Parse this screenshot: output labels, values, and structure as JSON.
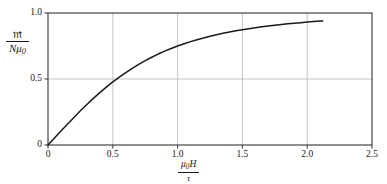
{
  "chart_data": {
    "type": "line",
    "title": "",
    "subtitle": "",
    "xlabel": "μ₀H / τ",
    "ylabel": "𝔪 / Nμ₀",
    "xlabel_numerator": "μ",
    "xlabel_numerator_sub": "0",
    "xlabel_numerator_tail": "H",
    "xlabel_denominator": "τ",
    "ylabel_numerator": "𝔪",
    "ylabel_denominator": "Nμ",
    "ylabel_denominator_sub": "0",
    "xlim": [
      0,
      2.5
    ],
    "ylim": [
      0,
      1.0
    ],
    "xticks": [
      0,
      0.5,
      1.0,
      1.5,
      2.0,
      2.5
    ],
    "xticklabels": [
      "0",
      "0.5",
      "1.0",
      "1.5",
      "2.0",
      "2.5"
    ],
    "yticks": [
      0,
      0.5,
      1.0
    ],
    "yticklabels": [
      "0",
      "0.5",
      "1.0"
    ],
    "grid": true,
    "grid_color": "#b8b8b8",
    "axis_color": "#333333",
    "curve_color": "#1a1a1a",
    "background_color": "#ffffff",
    "legend": null,
    "annotations": [],
    "series": [
      {
        "name": "Langevin function L(x) = coth(x) - 1/x",
        "x": [
          0.0,
          0.05,
          0.1,
          0.15,
          0.2,
          0.25,
          0.3,
          0.35,
          0.4,
          0.45,
          0.5,
          0.55,
          0.6,
          0.65,
          0.7,
          0.75,
          0.8,
          0.85,
          0.9,
          0.95,
          1.0,
          1.05,
          1.1,
          1.15,
          1.2,
          1.25,
          1.3,
          1.35,
          1.4,
          1.45,
          1.5,
          1.55,
          1.6,
          1.65,
          1.7,
          1.75,
          1.8,
          1.85,
          1.9,
          1.95,
          2.0,
          2.05,
          2.1,
          2.12
        ],
        "y": [
          0.0,
          0.053,
          0.106,
          0.158,
          0.209,
          0.259,
          0.307,
          0.353,
          0.397,
          0.438,
          0.478,
          0.514,
          0.549,
          0.581,
          0.611,
          0.639,
          0.665,
          0.689,
          0.711,
          0.731,
          0.75,
          0.767,
          0.783,
          0.798,
          0.811,
          0.824,
          0.835,
          0.846,
          0.856,
          0.865,
          0.873,
          0.881,
          0.888,
          0.895,
          0.901,
          0.907,
          0.913,
          0.918,
          0.923,
          0.927,
          0.931,
          0.935,
          0.939,
          0.94
        ]
      }
    ]
  }
}
